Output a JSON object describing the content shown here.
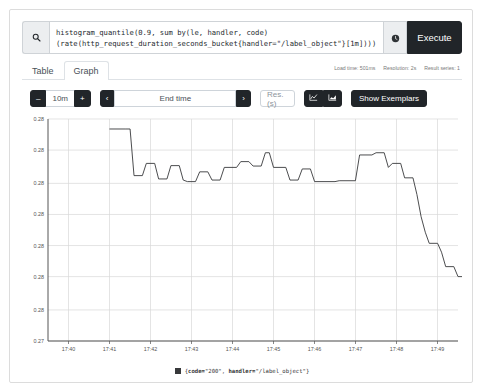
{
  "query": {
    "expression": "histogram_quantile(0.9, sum by(le, handler, code)\n(rate(http_request_duration_seconds_bucket{handler=\"/label_object\"}[1m])))",
    "search_icon": "search-icon",
    "history_icon": "history-clock-icon",
    "execute_label": "Execute"
  },
  "tabs": [
    {
      "label": "Table",
      "active": false
    },
    {
      "label": "Graph",
      "active": true
    }
  ],
  "status": {
    "load_time": "Load time: 501ms",
    "resolution": "Resolution: 2s",
    "result_series": "Result series: 1"
  },
  "controls": {
    "decrease_label": "–",
    "range_value": "10m",
    "increase_label": "+",
    "prev_label": "‹",
    "end_time_label": "End time",
    "next_label": "›",
    "resolution_placeholder": "Res. (s)",
    "resolution_value": "",
    "line_chart_icon": "line-chart-icon",
    "stacked_chart_icon": "stacked-chart-icon",
    "show_exemplars_label": "Show Exemplars"
  },
  "legend": {
    "series_label_plain": "{code=\"200\", handler=\"/label_object\"}",
    "label_open": "{",
    "key_code": "code=",
    "val_code": "\"200\", ",
    "key_handler": "handler=",
    "val_handler": "\"/label_object\"}",
    "color": "#38393b"
  },
  "chart_data": {
    "type": "line",
    "title": "",
    "xlabel": "",
    "ylabel": "",
    "line_color": "#38393b",
    "grid": true,
    "legend_position": "bottom",
    "xlim": [
      "17:39:30",
      "17:49:30"
    ],
    "ylim": [
      0.27,
      0.28
    ],
    "ytick_labels": [
      "0.28",
      "0.28",
      "0.28",
      "0.28",
      "0.28",
      "0.28",
      "0.28",
      "0.27"
    ],
    "ytick_values": [
      0.28,
      0.2786,
      0.2771,
      0.2757,
      0.2743,
      0.2729,
      0.2714,
      0.27
    ],
    "xtick_labels": [
      "17:40",
      "17:41",
      "17:42",
      "17:43",
      "17:44",
      "17:45",
      "17:46",
      "17:47",
      "17:48",
      "17:49"
    ],
    "series": [
      {
        "name": "{code=\"200\", handler=\"/label_object\"}",
        "points": [
          [
            17.6833,
            0.27955
          ],
          [
            17.69,
            0.27955
          ],
          [
            17.6917,
            0.27955
          ],
          [
            17.6933,
            0.27745
          ],
          [
            17.6967,
            0.27745
          ],
          [
            17.6983,
            0.278
          ],
          [
            17.7017,
            0.278
          ],
          [
            17.7033,
            0.2773
          ],
          [
            17.7067,
            0.2773
          ],
          [
            17.7083,
            0.2779
          ],
          [
            17.7117,
            0.2779
          ],
          [
            17.7133,
            0.27725
          ],
          [
            17.715,
            0.27718
          ],
          [
            17.7183,
            0.27718
          ],
          [
            17.72,
            0.27762
          ],
          [
            17.7233,
            0.27762
          ],
          [
            17.725,
            0.27725
          ],
          [
            17.7283,
            0.27725
          ],
          [
            17.73,
            0.27782
          ],
          [
            17.735,
            0.27782
          ],
          [
            17.7367,
            0.27808
          ],
          [
            17.74,
            0.27808
          ],
          [
            17.7417,
            0.27788
          ],
          [
            17.745,
            0.27788
          ],
          [
            17.7467,
            0.27848
          ],
          [
            17.7483,
            0.27848
          ],
          [
            17.75,
            0.27782
          ],
          [
            17.755,
            0.27782
          ],
          [
            17.7567,
            0.27725
          ],
          [
            17.76,
            0.27725
          ],
          [
            17.7617,
            0.27775
          ],
          [
            17.765,
            0.27775
          ],
          [
            17.7667,
            0.27718
          ],
          [
            17.775,
            0.27718
          ],
          [
            17.7767,
            0.27722
          ],
          [
            17.7833,
            0.27722
          ],
          [
            17.785,
            0.27838
          ],
          [
            17.79,
            0.27838
          ],
          [
            17.7917,
            0.27848
          ],
          [
            17.795,
            0.27848
          ],
          [
            17.7967,
            0.27782
          ],
          [
            17.7983,
            0.278
          ],
          [
            17.8017,
            0.278
          ],
          [
            17.8033,
            0.27735
          ],
          [
            17.8067,
            0.27735
          ],
          [
            17.8083,
            0.2766
          ],
          [
            17.81,
            0.2756
          ],
          [
            17.8117,
            0.2749
          ],
          [
            17.8133,
            0.2744
          ],
          [
            17.8167,
            0.2744
          ],
          [
            17.8183,
            0.274
          ],
          [
            17.82,
            0.27335
          ],
          [
            17.8233,
            0.27335
          ],
          [
            17.825,
            0.2729
          ],
          [
            17.835,
            0.2729
          ],
          [
            17.8367,
            0.27295
          ],
          [
            17.84,
            0.27295
          ],
          [
            17.8417,
            0.27355
          ],
          [
            17.8483,
            0.27355
          ],
          [
            17.85,
            0.27375
          ],
          [
            17.8517,
            0.2743
          ],
          [
            17.855,
            0.2743
          ],
          [
            17.8567,
            0.2748
          ],
          [
            17.8583,
            0.2756
          ],
          [
            17.86,
            0.2764
          ],
          [
            17.8617,
            0.277
          ],
          [
            17.865,
            0.277
          ],
          [
            17.8667,
            0.2774
          ],
          [
            17.8683,
            0.27818
          ],
          [
            17.87,
            0.27868
          ],
          [
            17.875,
            0.27868
          ],
          [
            17.8767,
            0.2784
          ],
          [
            17.88,
            0.2784
          ],
          [
            17.8817,
            0.27828
          ],
          [
            17.885,
            0.27828
          ],
          [
            17.8867,
            0.27795
          ],
          [
            17.8883,
            0.27778
          ],
          [
            17.89,
            0.2776
          ],
          [
            17.8917,
            0.27742
          ],
          [
            17.8933,
            0.277
          ],
          [
            17.895,
            0.2769
          ],
          [
            17.8967,
            0.27655
          ],
          [
            17.8983,
            0.277
          ],
          [
            17.9,
            0.2769
          ],
          [
            17.9017,
            0.27655
          ],
          [
            17.9033,
            0.2781
          ],
          [
            17.905,
            0.27655
          ],
          [
            17.9067,
            0.27745
          ],
          [
            17.91,
            0.27745
          ],
          [
            17.9117,
            0.2699
          ]
        ]
      }
    ]
  }
}
